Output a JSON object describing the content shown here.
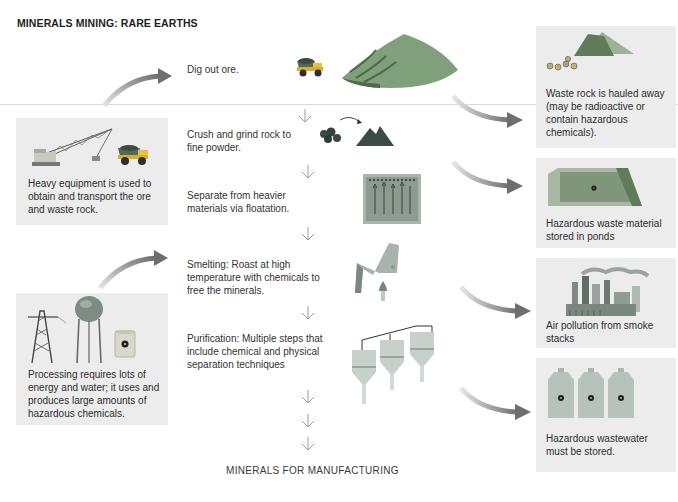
{
  "title": "MINERALS MINING: RARE EARTHS",
  "process_steps": [
    {
      "id": "dig",
      "label": "Dig out ore.",
      "icon": "truck-and-mine-pile-icon"
    },
    {
      "id": "crush",
      "label": "Crush and grind rock to fine powder.",
      "icon": "rocks-to-powder-icon"
    },
    {
      "id": "separate",
      "label": "Separate from heavier materials via floatation.",
      "icon": "floatation-tank-icon"
    },
    {
      "id": "smelt",
      "label": "Smelting: Roast at high temperature with chemicals to free the minerals.",
      "icon": "smelter-furnace-icon"
    },
    {
      "id": "purify",
      "label": "Purification: Multiple steps that include chemical and physical separation techniques",
      "icon": "separation-tanks-icon"
    }
  ],
  "final_output": "MINERALS FOR MANUFACTURING",
  "input_boxes": [
    {
      "id": "equipment",
      "text": "Heavy equipment is used to obtain and transport the ore and waste rock.",
      "icons": [
        "dragline-excavator-icon",
        "dump-truck-icon"
      ]
    },
    {
      "id": "processing",
      "text": "Processing requires lots of energy and water; it uses and produces large amounts of hazardous chemicals.",
      "icons": [
        "power-tower-icon",
        "water-tower-icon",
        "radioactive-barrel-icon"
      ]
    }
  ],
  "output_boxes": [
    {
      "id": "waste-rock",
      "text": "Waste rock is hauled away (may be radioactive or contain hazardous chemicals).",
      "icon": "waste-rock-pile-icon"
    },
    {
      "id": "waste-ponds",
      "text": "Hazardous waste material stored in ponds",
      "icon": "tailings-pond-icon"
    },
    {
      "id": "air-pollution",
      "text": "Air pollution from smoke stacks",
      "icon": "factory-smokestacks-icon"
    },
    {
      "id": "wastewater",
      "text": "Hazardous wastewater must be stored.",
      "icon": "radioactive-jugs-icon"
    }
  ],
  "colors": {
    "box_bg": "#ececec",
    "arrow": "#6e6e6e",
    "rule": "#d9d9d9",
    "mine_green": "#7fa07a",
    "powder_dark": "#3c4a43"
  }
}
